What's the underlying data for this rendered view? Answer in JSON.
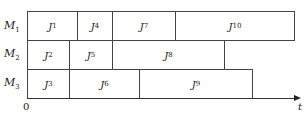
{
  "diagram": {
    "type": "gantt-schedule",
    "machines": [
      {
        "name": "M",
        "sub": "1",
        "jobs": [
          {
            "name": "J",
            "sub": "1",
            "x0": 27,
            "x1": 77
          },
          {
            "name": "J",
            "sub": "4",
            "x0": 77,
            "x1": 112
          },
          {
            "name": "J",
            "sub": "7",
            "x0": 112,
            "x1": 175
          },
          {
            "name": "J",
            "sub": "10",
            "x0": 175,
            "x1": 294
          }
        ]
      },
      {
        "name": "M",
        "sub": "2",
        "jobs": [
          {
            "name": "J",
            "sub": "2",
            "x0": 27,
            "x1": 69
          },
          {
            "name": "J",
            "sub": "5",
            "x0": 69,
            "x1": 112
          },
          {
            "name": "J",
            "sub": "8",
            "x0": 112,
            "x1": 224
          }
        ]
      },
      {
        "name": "M",
        "sub": "3",
        "jobs": [
          {
            "name": "J",
            "sub": "3",
            "x0": 27,
            "x1": 69
          },
          {
            "name": "J",
            "sub": "6",
            "x0": 69,
            "x1": 139
          },
          {
            "name": "J",
            "sub": "9",
            "x0": 139,
            "x1": 252
          }
        ]
      }
    ],
    "axis": {
      "origin_label": "0",
      "time_label": "t"
    }
  }
}
